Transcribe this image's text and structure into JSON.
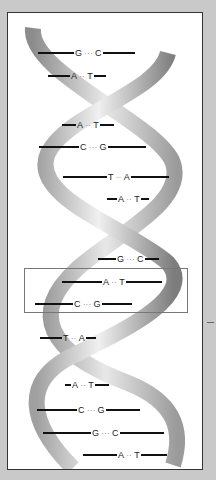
{
  "figure": {
    "highlighted_pair_index": 7
  },
  "colors": {
    "background": "#c9c9c9",
    "panel": "#ffffff",
    "strand_light": "#e6e6e6",
    "strand_dark": "#8a8a8a",
    "bond_line": "#111111"
  },
  "base_pairs": [
    {
      "left": "G",
      "bond": "···",
      "right": "C"
    },
    {
      "left": "A",
      "bond": "··",
      "right": "T"
    },
    {
      "left": "A",
      "bond": "··",
      "right": "T"
    },
    {
      "left": "C",
      "bond": "···",
      "right": "G"
    },
    {
      "left": "T",
      "bond": "··",
      "right": "A"
    },
    {
      "left": "A",
      "bond": "··",
      "right": "T"
    },
    {
      "left": "G",
      "bond": "···",
      "right": "C"
    },
    {
      "left": "A",
      "bond": "··",
      "right": "T"
    },
    {
      "left": "C",
      "bond": "···",
      "right": "G"
    },
    {
      "left": "T",
      "bond": "··",
      "right": "A"
    },
    {
      "left": "A",
      "bond": "··",
      "right": "T"
    },
    {
      "left": "C",
      "bond": "···",
      "right": "G"
    },
    {
      "left": "G",
      "bond": "···",
      "right": "C"
    },
    {
      "left": "A",
      "bond": "··",
      "right": "T"
    }
  ]
}
